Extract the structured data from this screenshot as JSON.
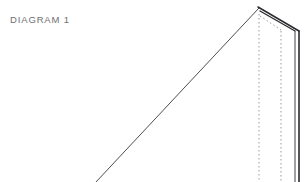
{
  "canvas": {
    "width": 304,
    "height": 182,
    "background_color": "#ffffff"
  },
  "label": {
    "text": "DIAGRAM 1",
    "color": "#6f6f73",
    "x": 10,
    "y": 22
  },
  "drawing": {
    "title": "DIAGRAM 1",
    "type": "line-drawing",
    "stroke_color_solid": "#2b2b2f",
    "stroke_color_dotted": "#9a9a9e",
    "apex": {
      "x": 259,
      "y": 8
    },
    "right_corner": {
      "x": 296,
      "y": 30
    },
    "strokes": [
      {
        "name": "long-diagonal-ridge",
        "style": "solid",
        "color": "#3a3a3e",
        "width": 0.9,
        "points": [
          [
            96,
            182
          ],
          [
            259,
            8
          ]
        ]
      },
      {
        "name": "roof-slope-outer",
        "style": "solid",
        "color": "#2b2b2f",
        "width": 1.5,
        "points": [
          [
            258,
            7
          ],
          [
            299,
            31
          ]
        ]
      },
      {
        "name": "roof-slope-inner",
        "style": "solid",
        "color": "#2b2b2f",
        "width": 1.3,
        "points": [
          [
            260,
            11
          ],
          [
            295,
            31
          ]
        ]
      },
      {
        "name": "roof-slope-dotted",
        "style": "dotted",
        "color": "#9a9a9e",
        "width": 1,
        "points": [
          [
            260,
            16
          ],
          [
            281,
            30
          ]
        ]
      },
      {
        "name": "left-vertical-dotted",
        "style": "dotted",
        "color": "#9a9a9e",
        "width": 1,
        "points": [
          [
            259,
            14
          ],
          [
            259,
            182
          ]
        ]
      },
      {
        "name": "middle-vertical-dotted",
        "style": "dotted",
        "color": "#9a9a9e",
        "width": 1,
        "points": [
          [
            281,
            31
          ],
          [
            281,
            182
          ]
        ]
      },
      {
        "name": "right-vertical-inner",
        "style": "solid",
        "color": "#52525a",
        "width": 1.1,
        "points": [
          [
            295,
            31
          ],
          [
            295,
            182
          ]
        ]
      },
      {
        "name": "right-vertical-outer",
        "style": "solid",
        "color": "#2b2b2f",
        "width": 1.6,
        "points": [
          [
            299,
            31
          ],
          [
            299,
            182
          ]
        ]
      }
    ]
  }
}
